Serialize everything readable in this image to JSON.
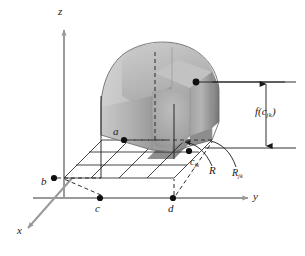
{
  "figure": {
    "axes": {
      "z_label": "z",
      "x_label": "x",
      "y_label": "y"
    },
    "points": {
      "a_label": "a",
      "b_label": "b",
      "c_label": "c",
      "d_label": "d"
    },
    "annotations": {
      "sample_point": {
        "base": "c",
        "sub": "jk"
      },
      "region": "R",
      "subrectangle": {
        "base": "R",
        "sub": "jk"
      },
      "height": {
        "prefix": "f(c",
        "sub": "jk",
        "suffix": ")"
      }
    },
    "colors": {
      "axis": "#9a9a9a",
      "outline": "#1a1a1a",
      "surface_light": "#c6c6c6",
      "surface_mid": "#a8a8a8",
      "surface_dark": "#8a8a8a",
      "shadow_region": "#7d7d7d",
      "background": "#ffffff"
    },
    "grid": {
      "columns": 4,
      "rows": 3
    }
  }
}
